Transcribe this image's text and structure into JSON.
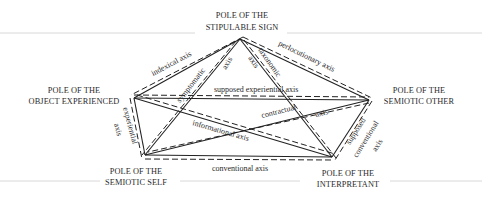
{
  "diagram": {
    "poles": [
      {
        "id": "stipulable-sign",
        "line1": "POLE OF THE",
        "line2": "STIPULABLE SIGN"
      },
      {
        "id": "object-experienced",
        "line1": "POLE OF THE",
        "line2": "OBJECT EXPERIENCED"
      },
      {
        "id": "semiotic-other",
        "line1": "POLE OF THE",
        "line2": "SEMIOTIC OTHER"
      },
      {
        "id": "semiotic-self",
        "line1": "POLE OF THE",
        "line2": "SEMIOTIC SELF"
      },
      {
        "id": "interpretant",
        "line1": "POLE OF THE",
        "line2": "INTERPRETANT"
      }
    ],
    "axes": {
      "indexical": "indexical axis",
      "symptomatic_1": "symptomatic",
      "symptomatic_2": "axis",
      "taxonomic_1": "taxonomic",
      "taxonomic_2": "axis",
      "perlocutionary": "perlocutionary axis",
      "supposed_experiential": "supposed experiential axis",
      "experiential_1": "experiential",
      "experiential_2": "axis",
      "contractual_1": "contractual",
      "contractual_2": "axis",
      "informational": "informational axis",
      "supposed_conventional_1": "supposed",
      "supposed_conventional_2": "conventional",
      "supposed_conventional_3": "axis",
      "conventional": "conventional axis"
    }
  }
}
